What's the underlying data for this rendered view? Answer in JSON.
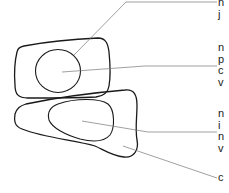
{
  "diagram": {
    "type": "cell-structure-illustration",
    "colors": {
      "outline": "#1a1a1a",
      "leader": "#777777",
      "text": "#1a1a1a",
      "background": "#ffffff"
    },
    "shapes": [
      {
        "id": "upper-cell",
        "kind": "cell-membrane"
      },
      {
        "id": "upper-nucleus",
        "kind": "nucleus"
      },
      {
        "id": "lower-cell",
        "kind": "cell-membrane"
      },
      {
        "id": "lower-nucleus",
        "kind": "nucleus"
      }
    ],
    "labels": [
      {
        "id": "label-1",
        "lines": [
          "n",
          "j"
        ],
        "points_to": "upper-nucleus"
      },
      {
        "id": "label-2",
        "lines": [
          "n",
          "p",
          "c",
          "v"
        ],
        "points_to": "upper-cell"
      },
      {
        "id": "label-3",
        "lines": [
          "n",
          "i",
          "n",
          "v"
        ],
        "points_to": "lower-nucleus"
      },
      {
        "id": "label-4",
        "lines": [
          "c"
        ],
        "points_to": "lower-cell"
      }
    ]
  }
}
